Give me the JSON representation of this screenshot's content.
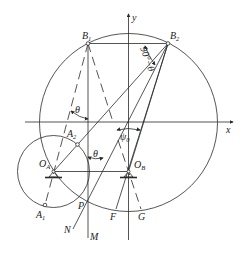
{
  "diagram": {
    "labels": {
      "B1": "B",
      "B1_sub": "1",
      "B2": "B",
      "B2_sub": "2",
      "A1": "A",
      "A1_sub": "1",
      "A2": "A",
      "A2_sub": "2",
      "OA": "O",
      "OA_sub": "A",
      "OB": "O",
      "OB_sub": "B",
      "x_axis": "x",
      "y_axis": "y",
      "theta_upper": "θ",
      "theta_lower": "θ",
      "psi0": "ψ",
      "psi0_sub": "0",
      "angle_90_minus_theta": "90°−θ",
      "P": "P",
      "F": "F",
      "G": "G",
      "M": "M",
      "N": "N"
    },
    "colors": {
      "line": "#2a2a2a",
      "background": "#ffffff"
    }
  }
}
